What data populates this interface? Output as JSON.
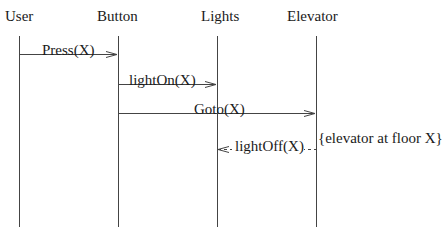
{
  "diagram": {
    "type": "sequence",
    "participants": [
      {
        "id": "user",
        "label": "User"
      },
      {
        "id": "button",
        "label": "Button"
      },
      {
        "id": "lights",
        "label": "Lights"
      },
      {
        "id": "elevator",
        "label": "Elevator"
      }
    ],
    "messages": [
      {
        "from": "user",
        "to": "button",
        "label": "Press(X)",
        "style": "solid"
      },
      {
        "from": "button",
        "to": "lights",
        "label": "lightOn(X)",
        "style": "solid"
      },
      {
        "from": "button",
        "to": "elevator",
        "label": "Goto(X)",
        "style": "solid"
      },
      {
        "from": "elevator",
        "to": "lights",
        "label": "lightOff(X)",
        "style": "dashed"
      }
    ],
    "annotations": [
      {
        "attached_to": "elevator",
        "label": "{elevator at floor X}"
      }
    ]
  }
}
